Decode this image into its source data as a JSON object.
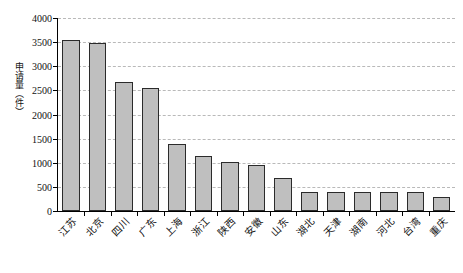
{
  "chart_data": {
    "type": "bar",
    "title": "",
    "subtitle": "",
    "xlabel": "",
    "ylabel": "申请量（件）",
    "ylim": [
      0,
      4000
    ],
    "ytick_step": 500,
    "yticks": [
      0,
      500,
      1000,
      1500,
      2000,
      2500,
      3000,
      3500,
      4000
    ],
    "ytick_labels": [
      "0",
      "500",
      "1000",
      "1500",
      "2000",
      "2500",
      "3000",
      "3500",
      "4000"
    ],
    "grid": true,
    "grid_axis": "y",
    "legend": false,
    "legend_position": "none",
    "categories": [
      "江苏",
      "北京",
      "四川",
      "广东",
      "上海",
      "浙江",
      "陕西",
      "安徽",
      "山东",
      "湖北",
      "天津",
      "湖南",
      "河北",
      "台湾",
      "重庆"
    ],
    "values": [
      3550,
      3490,
      2680,
      2540,
      1390,
      1130,
      1010,
      960,
      690,
      400,
      400,
      400,
      390,
      390,
      290
    ],
    "bar_fill_color": "#bfbfbf",
    "bar_edge_color": "#2b2b2b",
    "grid_color": "#b9b9b9",
    "axis_color": "#000000",
    "background_color": "#ffffff"
  }
}
